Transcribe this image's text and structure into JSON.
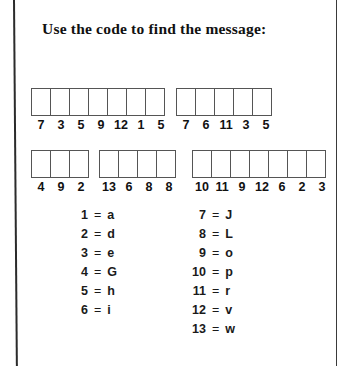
{
  "worksheet": {
    "title": "Use the code to find the message:",
    "word_rows": [
      {
        "groups": [
          {
            "name": "word-1",
            "numbers": [
              "7",
              "3",
              "5",
              "9",
              "12",
              "1",
              "5"
            ],
            "left": 31,
            "top": 88
          },
          {
            "name": "word-2",
            "numbers": [
              "7",
              "6",
              "11",
              "3",
              "5"
            ],
            "left": 176,
            "top": 88
          }
        ]
      },
      {
        "groups": [
          {
            "name": "word-3",
            "numbers": [
              "4",
              "9",
              "2"
            ],
            "left": 31,
            "top": 150
          },
          {
            "name": "word-4",
            "numbers": [
              "13",
              "6",
              "8",
              "8"
            ],
            "left": 99,
            "top": 150
          },
          {
            "name": "word-5",
            "numbers": [
              "10",
              "11",
              "9",
              "12",
              "6",
              "2",
              "3"
            ],
            "left": 192,
            "top": 150
          }
        ]
      }
    ],
    "legend": {
      "equals_sign": "=",
      "left_column": [
        {
          "key": "1",
          "value": "a"
        },
        {
          "key": "2",
          "value": "d"
        },
        {
          "key": "3",
          "value": "e"
        },
        {
          "key": "4",
          "value": "G"
        },
        {
          "key": "5",
          "value": "h"
        },
        {
          "key": "6",
          "value": "i"
        }
      ],
      "right_column": [
        {
          "key": "7",
          "value": "J"
        },
        {
          "key": "8",
          "value": "L"
        },
        {
          "key": "9",
          "value": "o"
        },
        {
          "key": "10",
          "value": "p"
        },
        {
          "key": "11",
          "value": "r"
        },
        {
          "key": "12",
          "value": "v"
        },
        {
          "key": "13",
          "value": "w"
        }
      ]
    },
    "colors": {
      "page_background": "#ffffff",
      "ink": "#111111",
      "box_stroke": "#555555",
      "edge_rule": "#2b2b2b"
    }
  }
}
